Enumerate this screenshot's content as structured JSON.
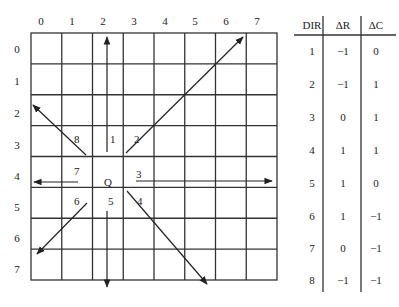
{
  "grid": {
    "rows": 8,
    "cols": 8,
    "col_labels": [
      "0",
      "1",
      "2",
      "3",
      "4",
      "5",
      "6",
      "7"
    ],
    "row_labels": [
      "0",
      "1",
      "2",
      "3",
      "4",
      "5",
      "6",
      "7"
    ],
    "origin_label": "Q",
    "origin_cell": {
      "row": 4,
      "col": 2
    }
  },
  "direction_labels": [
    {
      "dir": "1",
      "row": 3,
      "col": 2
    },
    {
      "dir": "2",
      "row": 3,
      "col": 3
    },
    {
      "dir": "3",
      "row": 4,
      "col": 3
    },
    {
      "dir": "4",
      "row": 5,
      "col": 3
    },
    {
      "dir": "5",
      "row": 5,
      "col": 2
    },
    {
      "dir": "6",
      "row": 5,
      "col": 1
    },
    {
      "dir": "7",
      "row": 4,
      "col": 1
    },
    {
      "dir": "8",
      "row": 3,
      "col": 1
    }
  ],
  "table": {
    "headers": [
      "DIR",
      "ΔR",
      "ΔC"
    ],
    "rows": [
      [
        "1",
        "−1",
        "0"
      ],
      [
        "2",
        "−1",
        "1"
      ],
      [
        "3",
        "0",
        "1"
      ],
      [
        "4",
        "1",
        "1"
      ],
      [
        "5",
        "1",
        "0"
      ],
      [
        "6",
        "1",
        "−1"
      ],
      [
        "7",
        "0",
        "−1"
      ],
      [
        "8",
        "−1",
        "−1"
      ]
    ]
  }
}
